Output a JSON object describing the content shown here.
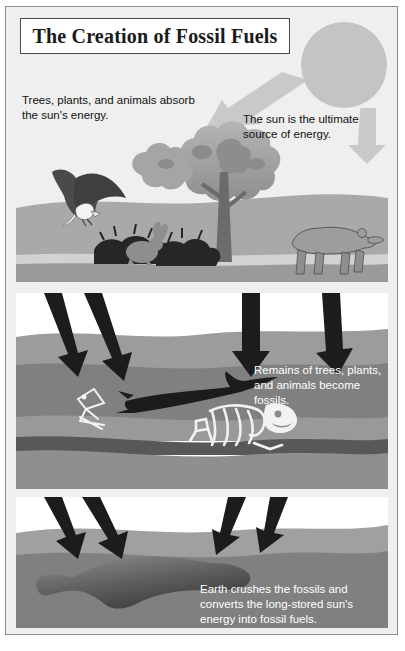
{
  "poster": {
    "title": "The Creation of Fossil Fuels",
    "panels": [
      {
        "id": "panel-surface",
        "name": "surface-scene",
        "captions": [
          {
            "id": "trees-caption",
            "text": "Trees, plants, and animals absorb the sun's energy."
          },
          {
            "id": "sun-caption",
            "text": "The sun is the ultimate source of energy."
          }
        ],
        "figures": [
          "sun",
          "energy-arrow-left",
          "energy-arrow-right",
          "eagle",
          "tree",
          "bear",
          "rabbit",
          "bushes",
          "ground-layers"
        ]
      },
      {
        "id": "panel-burial",
        "name": "burial-scene",
        "captions": [
          {
            "id": "remains-caption",
            "text": "Remains of trees, plants, and animals become fossils."
          }
        ],
        "figures": [
          "pressure-arrow-1",
          "pressure-arrow-2",
          "pressure-arrow-3",
          "pressure-arrow-4",
          "log-fossil",
          "bone-fossil",
          "skeleton-fossil",
          "rock-strata"
        ]
      },
      {
        "id": "panel-fuel",
        "name": "fossil-fuel-scene",
        "captions": [
          {
            "id": "earth-caption",
            "text": "Earth crushes the fossils and converts the long-stored sun's energy into fossil fuels."
          }
        ],
        "figures": [
          "pressure-arrow-1",
          "pressure-arrow-2",
          "pressure-arrow-3",
          "pressure-arrow-4",
          "oil-deposit",
          "rock-strata"
        ]
      }
    ]
  },
  "colors": {
    "background": "#efefef",
    "frame_border": "#8c8c8c",
    "title_text": "#1a1a1a",
    "title_border": "#4a4a4a",
    "body_text": "#111111",
    "caption_white": "#ffffff",
    "sun": "#c4c4c4",
    "energy_arrow": "#c9c9c9",
    "pressure_arrow": "#1c1c1c",
    "ground_light": "#d8d8d8",
    "ground_mid": "#a9a9a9",
    "ground_dark": "#8e8e8e",
    "strata_1": "#b5b5b5",
    "strata_2": "#9a9a9a",
    "strata_3": "#8a8a8a",
    "strata_4": "#6f6f6f",
    "strata_5": "#545454",
    "foliage_light": "#b0b0b0",
    "foliage_dark": "#8d8d8d",
    "trunk": "#6b6b6b",
    "animal": "#9d9d9d",
    "bush": "#2b2b2b",
    "eagle_body": "#4a4a4a",
    "bone": "#f2f2f2",
    "oil": "#5d5d5d"
  }
}
